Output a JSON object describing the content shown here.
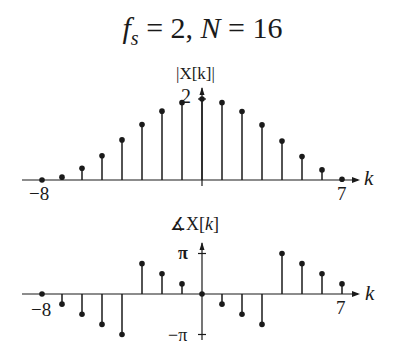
{
  "title": {
    "fs_symbol": "f",
    "fs_sub": "s",
    "fs_eq": " = 2, ",
    "N_symbol": "N",
    "N_eq": " = 16"
  },
  "chart_data": [
    {
      "type": "stem",
      "title": "f_s = 2, N = 16",
      "ylabel": "|X[k]|",
      "xlabel": "k",
      "x": [
        -8,
        -7,
        -6,
        -5,
        -4,
        -3,
        -2,
        -1,
        0,
        1,
        2,
        3,
        4,
        5,
        6,
        7
      ],
      "values": [
        0.0,
        0.07,
        0.29,
        0.6,
        0.99,
        1.37,
        1.7,
        1.91,
        2.0,
        1.91,
        1.69,
        1.36,
        0.96,
        0.58,
        0.25,
        0.02
      ],
      "ytick_labels": [
        "2"
      ],
      "yticks": [
        2
      ],
      "xtick_labels": [
        "−8",
        "7"
      ],
      "xticks": [
        -8,
        7
      ],
      "ylim": [
        0,
        2.2
      ],
      "grid": false
    },
    {
      "type": "stem",
      "ylabel": "∡X[k]",
      "xlabel": "k",
      "x": [
        -8,
        -7,
        -6,
        -5,
        -4,
        -3,
        -2,
        -1,
        0,
        1,
        2,
        3,
        4,
        5,
        6,
        7
      ],
      "values_over_pi": [
        0,
        -0.25,
        -0.5,
        -0.75,
        -1.0,
        0.75,
        0.5,
        0.25,
        0,
        -0.25,
        -0.5,
        -0.75,
        1.0,
        0.75,
        0.5,
        0.25
      ],
      "ytick_labels": [
        "π",
        "−π"
      ],
      "yticks": [
        3.14159,
        -3.14159
      ],
      "xtick_labels": [
        "−8",
        "7"
      ],
      "xticks": [
        -8,
        7
      ],
      "ylim": [
        -3.3,
        3.5
      ],
      "grid": false
    }
  ],
  "labels": {
    "top_ylabel": "|X[k]|",
    "top_ytick": "2",
    "top_xmin": "−8",
    "top_xmax": "7",
    "top_xlabel": "k",
    "bot_ylabel_angle": "∡",
    "bot_ylabel_X": "X[",
    "bot_ylabel_k": "k",
    "bot_ylabel_close": "]",
    "bot_ytick_pos": "π",
    "bot_ytick_neg": "−π",
    "bot_xmin": "−8",
    "bot_xmax": "7",
    "bot_xlabel": "k"
  },
  "style": {
    "ink": "#1a1a1a",
    "x0": 202,
    "dx": 20,
    "top_axis_y": 180,
    "top_px_per_unit": 40.5,
    "bot_axis_y": 294,
    "bot_px_per_pi": 40.5
  }
}
